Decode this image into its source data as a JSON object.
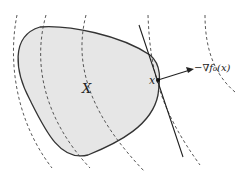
{
  "diagram": {
    "set_label": "X",
    "point_label": "x",
    "gradient_label": "−∇f₀(x)",
    "colors": {
      "fill": "#e6e6e6",
      "stroke": "#333333",
      "dash": "#444444"
    }
  }
}
